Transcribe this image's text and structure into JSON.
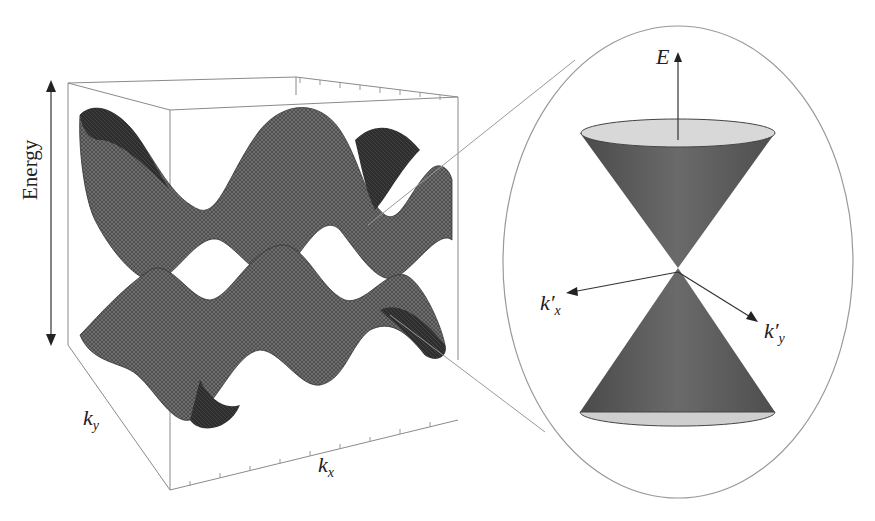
{
  "figure": {
    "left_panel": {
      "title": "Graphene band structure (3D surface)",
      "axis_labels": {
        "vertical": "Energy",
        "depth": "k",
        "depth_sub": "y",
        "horizontal": "k",
        "horizontal_sub": "x"
      }
    },
    "right_panel": {
      "title": "Dirac cone (magnified)",
      "axis_labels": {
        "vertical": "E",
        "left": "k′",
        "left_sub": "x",
        "right": "k′",
        "right_sub": "y"
      }
    },
    "colors": {
      "surface_dark": "#2a2a2a",
      "surface_mid": "#6a6a6a",
      "cone": "#5a5a5a",
      "cone_cap": "#d6d6d6",
      "frame": "#888888"
    }
  }
}
